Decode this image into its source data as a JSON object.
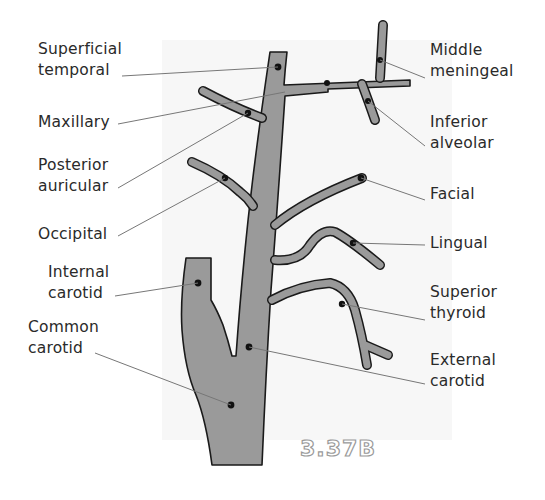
{
  "figure_label": "3.37B",
  "colors": {
    "vessel_fill": "#9a9a9a",
    "vessel_outline": "#1a1a1a",
    "leader_line": "#777777",
    "panel_bg": "#f7f7f7",
    "text": "#2a2a2a"
  },
  "labels": {
    "superficial_temporal": [
      "Superficial",
      "temporal"
    ],
    "maxillary": [
      "Maxillary"
    ],
    "posterior_auricular": [
      "Posterior",
      "auricular"
    ],
    "occipital": [
      "Occipital"
    ],
    "internal_carotid": [
      "Internal",
      "carotid"
    ],
    "common_carotid": [
      "Common",
      "carotid"
    ],
    "middle_meningeal": [
      "Middle",
      "meningeal"
    ],
    "inferior_alveolar": [
      "Inferior",
      "alveolar"
    ],
    "facial": [
      "Facial"
    ],
    "lingual": [
      "Lingual"
    ],
    "superior_thyroid": [
      "Superior",
      "thyroid"
    ],
    "external_carotid": [
      "External",
      "carotid"
    ]
  }
}
